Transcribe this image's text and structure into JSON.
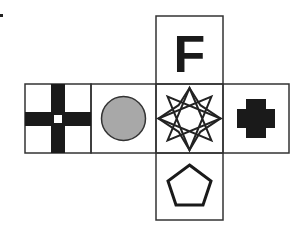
{
  "diagram": {
    "type": "cube-net",
    "faces": [
      {
        "position": "top",
        "content": "letter",
        "label": "F",
        "color": "#1a1a1a"
      },
      {
        "position": "left-1",
        "content": "window-cross-icon",
        "color": "#1a1a1a"
      },
      {
        "position": "left-2",
        "content": "circle-icon",
        "fill": "#a8a8a8",
        "stroke": "#333333"
      },
      {
        "position": "center",
        "content": "eight-point-star-icon",
        "color": "#222222"
      },
      {
        "position": "right",
        "content": "plus-cross-icon",
        "color": "#1a1a1a"
      },
      {
        "position": "bottom",
        "content": "pentagon-icon",
        "color": "#1a1a1a"
      }
    ],
    "border_color": "#333333"
  }
}
